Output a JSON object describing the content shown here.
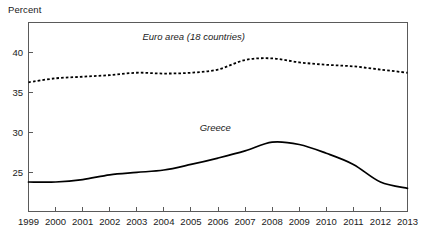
{
  "chart_data": {
    "type": "line",
    "title": "",
    "xlabel": "",
    "ylabel": "Percent",
    "grid": false,
    "legend_position": "inline-annotation",
    "x": [
      1999,
      2000,
      2001,
      2002,
      2003,
      2004,
      2005,
      2006,
      2007,
      2008,
      2009,
      2010,
      2011,
      2012,
      2013
    ],
    "xtick_labels": [
      "1999",
      "2000",
      "2001",
      "2002",
      "2003",
      "2004",
      "2005",
      "2006",
      "2007",
      "2008",
      "2009",
      "2010",
      "2011",
      "2012",
      "2013"
    ],
    "ytick_labels": [
      "40",
      "35",
      "30",
      "25"
    ],
    "yticks": [
      40,
      35,
      30,
      25
    ],
    "xlim": [
      1999,
      2013
    ],
    "ylim": [
      20.1,
      43.8
    ],
    "series": [
      {
        "name": "Euro area (18 countries)",
        "style": "dotted",
        "label_x": 2005.1,
        "label_y": 41.6,
        "values": [
          36.3,
          36.8,
          37.0,
          37.2,
          37.5,
          37.4,
          37.5,
          37.9,
          39.1,
          39.3,
          38.8,
          38.5,
          38.3,
          37.9,
          37.5
        ]
      },
      {
        "name": "Greece",
        "style": "solid",
        "label_x": 2005.9,
        "label_y": 30.2,
        "values": [
          23.8,
          23.8,
          24.1,
          24.7,
          25.0,
          25.3,
          26.0,
          26.8,
          27.7,
          28.8,
          28.5,
          27.4,
          26.0,
          23.8,
          23.0
        ]
      }
    ]
  },
  "axes": {
    "ylabel_text": "Percent"
  }
}
